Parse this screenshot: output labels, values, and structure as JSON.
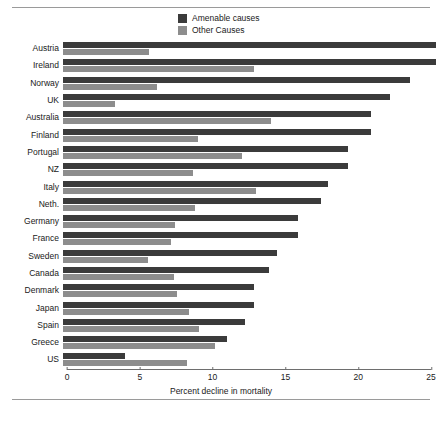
{
  "chart_data": {
    "type": "bar",
    "orientation": "horizontal",
    "title": "",
    "xlabel": "Percent decline in mortality",
    "ylabel": "",
    "xlim": [
      0,
      25
    ],
    "xticks": [
      0,
      5,
      10,
      15,
      20,
      25
    ],
    "grid": false,
    "legend_position": "top-center",
    "categories": [
      "Austria",
      "Ireland",
      "Norway",
      "UK",
      "Australia",
      "Finland",
      "Portugal",
      "NZ",
      "Italy",
      "Neth.",
      "Germany",
      "France",
      "Sweden",
      "Canada",
      "Denmark",
      "Japan",
      "Spain",
      "Greece",
      "US"
    ],
    "series": [
      {
        "name": "Amenable causes",
        "color": "#3b3b3b",
        "values": [
          24.6,
          24.6,
          22.9,
          21.6,
          20.3,
          20.3,
          18.8,
          18.8,
          17.5,
          17.0,
          15.5,
          15.5,
          14.1,
          13.6,
          12.6,
          12.6,
          12.0,
          10.8,
          4.1
        ]
      },
      {
        "name": "Other Causes",
        "color": "#8d8d8d",
        "values": [
          5.7,
          12.6,
          6.2,
          3.4,
          13.7,
          8.9,
          11.8,
          8.6,
          12.7,
          8.7,
          7.4,
          7.1,
          5.6,
          7.3,
          7.5,
          8.3,
          9.0,
          10.0,
          8.2
        ]
      }
    ]
  },
  "legend": {
    "items": [
      {
        "label": "Amenable causes",
        "color": "#3b3b3b"
      },
      {
        "label": "Other Causes",
        "color": "#8d8d8d"
      }
    ]
  },
  "axis": {
    "xlabel": "Percent decline in mortality",
    "ticks": [
      "0",
      "5",
      "10",
      "15",
      "20",
      "25"
    ]
  }
}
